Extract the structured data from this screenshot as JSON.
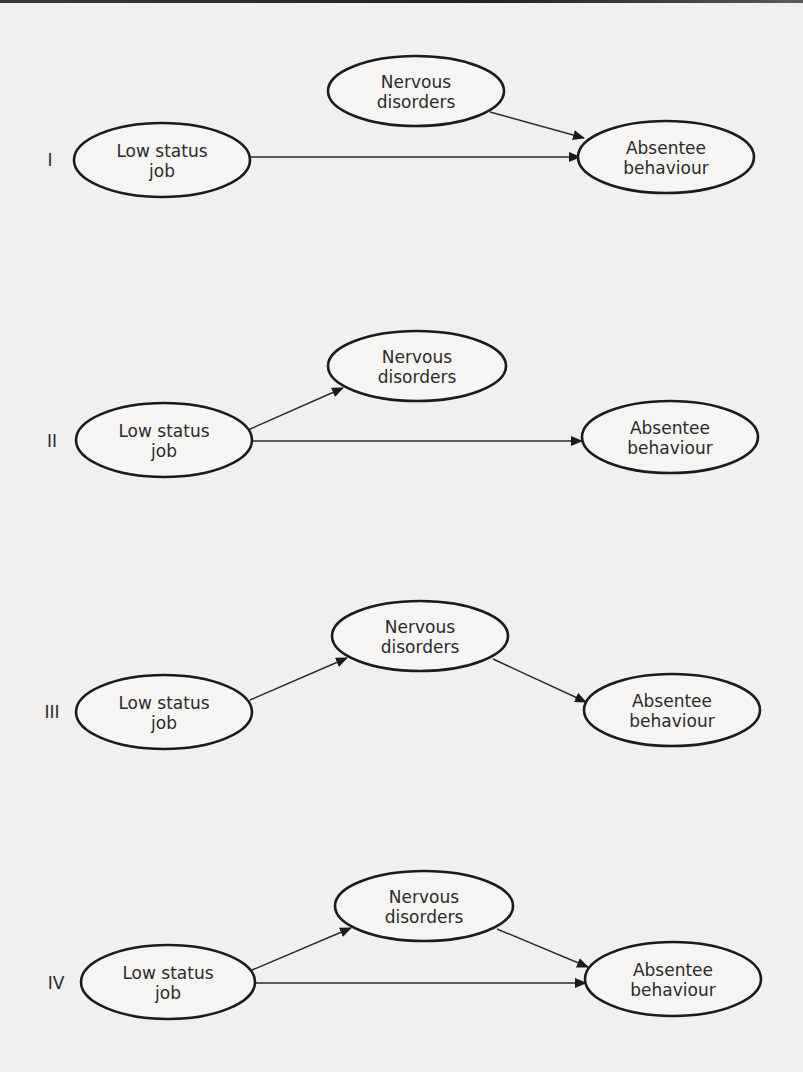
{
  "colors": {
    "background": "#f1f0ee",
    "stroke": "#1b1b1b",
    "text": "#2b2b2b"
  },
  "node_labels": {
    "low_status": [
      "Low status",
      "job"
    ],
    "nervous": [
      "Nervous",
      "disorders"
    ],
    "absentee": [
      "Absentee",
      "behaviour"
    ]
  },
  "diagrams": [
    {
      "id": "I",
      "label": "I",
      "label_pos": [
        50,
        160
      ],
      "nodes": {
        "low_status": {
          "cx": 162,
          "cy": 160,
          "rx": 88,
          "ry": 37,
          "line1": "Low status",
          "line2": "job"
        },
        "nervous": {
          "cx": 416,
          "cy": 91,
          "rx": 88,
          "ry": 35,
          "line1": "Nervous",
          "line2": "disorders"
        },
        "absentee": {
          "cx": 666,
          "cy": 157,
          "rx": 88,
          "ry": 36,
          "line1": "Absentee",
          "line2": "behaviour"
        }
      },
      "edges": [
        {
          "from": "low_status",
          "to": "absentee",
          "x1": 251,
          "y1": 157,
          "x2": 580,
          "y2": 157
        },
        {
          "from": "nervous",
          "to": "absentee",
          "x1": 490,
          "y1": 112,
          "x2": 584,
          "y2": 138
        }
      ]
    },
    {
      "id": "II",
      "label": "II",
      "label_pos": [
        52,
        441
      ],
      "nodes": {
        "low_status": {
          "cx": 164,
          "cy": 440,
          "rx": 88,
          "ry": 37,
          "line1": "Low status",
          "line2": "job"
        },
        "nervous": {
          "cx": 417,
          "cy": 366,
          "rx": 89,
          "ry": 35,
          "line1": "Nervous",
          "line2": "disorders"
        },
        "absentee": {
          "cx": 670,
          "cy": 437,
          "rx": 88,
          "ry": 36,
          "line1": "Absentee",
          "line2": "behaviour"
        }
      },
      "edges": [
        {
          "from": "low_status",
          "to": "nervous",
          "x1": 248,
          "y1": 430,
          "x2": 343,
          "y2": 388
        },
        {
          "from": "low_status",
          "to": "absentee",
          "x1": 252,
          "y1": 441,
          "x2": 582,
          "y2": 441
        }
      ]
    },
    {
      "id": "III",
      "label": "III",
      "label_pos": [
        52,
        712
      ],
      "nodes": {
        "low_status": {
          "cx": 164,
          "cy": 712,
          "rx": 88,
          "ry": 37,
          "line1": "Low status",
          "line2": "job"
        },
        "nervous": {
          "cx": 420,
          "cy": 636,
          "rx": 88,
          "ry": 35,
          "line1": "Nervous",
          "line2": "disorders"
        },
        "absentee": {
          "cx": 672,
          "cy": 710,
          "rx": 88,
          "ry": 36,
          "line1": "Absentee",
          "line2": "behaviour"
        }
      },
      "edges": [
        {
          "from": "low_status",
          "to": "nervous",
          "x1": 250,
          "y1": 700,
          "x2": 347,
          "y2": 658
        },
        {
          "from": "nervous",
          "to": "absentee",
          "x1": 493,
          "y1": 659,
          "x2": 586,
          "y2": 702
        }
      ]
    },
    {
      "id": "IV",
      "label": "IV",
      "label_pos": [
        56,
        983
      ],
      "nodes": {
        "low_status": {
          "cx": 168,
          "cy": 982,
          "rx": 87,
          "ry": 37,
          "line1": "Low status",
          "line2": "job"
        },
        "nervous": {
          "cx": 424,
          "cy": 906,
          "rx": 89,
          "ry": 35,
          "line1": "Nervous",
          "line2": "disorders"
        },
        "absentee": {
          "cx": 673,
          "cy": 979,
          "rx": 88,
          "ry": 37,
          "line1": "Absentee",
          "line2": "behaviour"
        }
      },
      "edges": [
        {
          "from": "low_status",
          "to": "nervous",
          "x1": 252,
          "y1": 970,
          "x2": 351,
          "y2": 928
        },
        {
          "from": "low_status",
          "to": "absentee",
          "x1": 256,
          "y1": 983,
          "x2": 586,
          "y2": 983
        },
        {
          "from": "nervous",
          "to": "absentee",
          "x1": 497,
          "y1": 929,
          "x2": 588,
          "y2": 967
        }
      ]
    }
  ]
}
